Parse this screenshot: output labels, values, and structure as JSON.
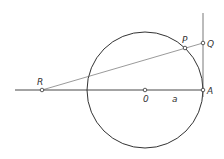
{
  "diagram": {
    "type": "geometry-construction",
    "circle": {
      "cx": 145,
      "cy": 90,
      "r": 58,
      "stroke": "#333333"
    },
    "axis_line": {
      "x1": 15,
      "y1": 90,
      "x2": 203,
      "y2": 90
    },
    "tangent_line": {
      "x1": 203,
      "y1": 13,
      "x2": 203,
      "y2": 97
    },
    "secant_line": {
      "x1": 42,
      "y1": 90,
      "x2": 203,
      "y2": 43
    },
    "points": [
      {
        "id": "R",
        "label": "R",
        "x": 42,
        "y": 90,
        "lx": 37,
        "ly": 85
      },
      {
        "id": "O",
        "label": "0",
        "x": 145,
        "y": 90,
        "lx": 143,
        "ly": 102
      },
      {
        "id": "A",
        "label": "A",
        "x": 203,
        "y": 90,
        "lx": 207,
        "ly": 94
      },
      {
        "id": "P",
        "label": "P",
        "x": 185,
        "y": 48,
        "lx": 182,
        "ly": 43
      },
      {
        "id": "Q",
        "label": "Q",
        "x": 203,
        "y": 43,
        "lx": 207,
        "ly": 47
      }
    ],
    "segment_label": {
      "text": "a",
      "x": 172,
      "y": 102
    }
  }
}
